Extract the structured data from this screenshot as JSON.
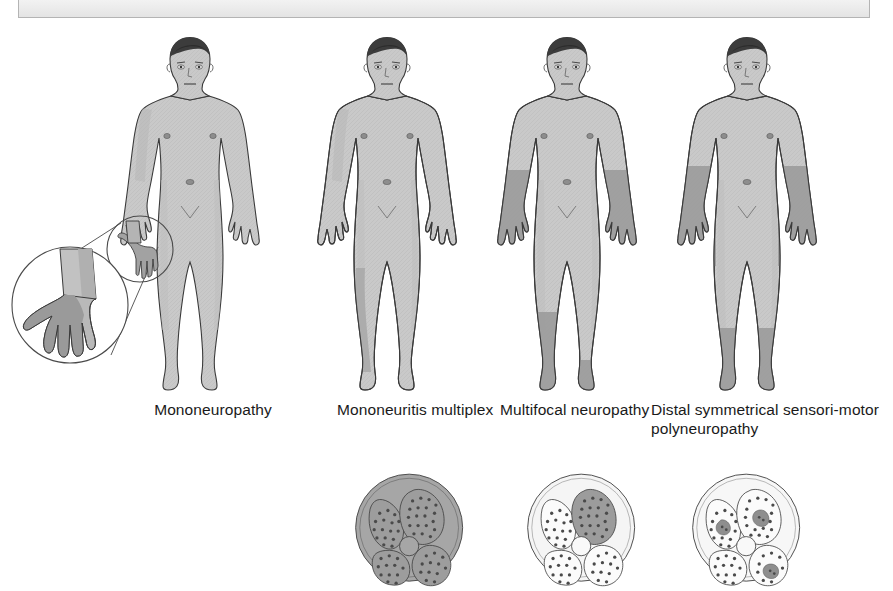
{
  "page": {
    "background_color": "#ffffff"
  },
  "top_box": {
    "name": "clipped-header-bar",
    "border_color": "#b4b4b4",
    "fill_color": "#f2f2f2",
    "text": ""
  },
  "palette": {
    "skin_light": "#c9c9c9",
    "skin_shadow": "#b0b0b0",
    "affected_gray": "#9a9a9a",
    "outline": "#3a3a3a",
    "hair_dark": "#3c3c3c",
    "nerve_fill_affected": "#a0a0a0",
    "nerve_fill_normal": "#f4f4f4",
    "nerve_sheath_affected": "#9b9b9b",
    "nerve_sheath_normal": "#f1f1f1",
    "axon_dot": "#4a4a4a"
  },
  "figures": [
    {
      "id": "fig1",
      "caption": "Mononeuropathy",
      "pattern": "single nerve territory — right hand median distribution",
      "affected_regions": [
        "right-hand-median-territory"
      ],
      "has_magnifier_inset": true,
      "inset": {
        "name": "hand-magnifier-inset",
        "small_circle_label": "",
        "large_circle_label": "",
        "shaded_area": "median nerve sensory territory of the hand"
      }
    },
    {
      "id": "fig2",
      "caption": "Mononeuritis multiplex",
      "pattern": "several separate individual nerves",
      "affected_regions": [
        "right-lateral-lower-leg"
      ],
      "has_magnifier_inset": false
    },
    {
      "id": "fig3",
      "caption": "Multifocal neuropathy",
      "pattern": "asymmetrical patchy involvement",
      "affected_regions": [
        "both-forearms",
        "right-lower-leg-and-foot",
        "left-ankle-and-foot"
      ],
      "has_magnifier_inset": false
    },
    {
      "id": "fig4",
      "caption": "Distal symmetrical sensori-motor polyneuropathy",
      "pattern": "symmetrical glove-and-stocking distribution",
      "affected_regions": [
        "both-forearms-and-hands",
        "both-lower-legs-and-feet"
      ],
      "has_magnifier_inset": false
    }
  ],
  "cross_sections": [
    {
      "id": "xs1",
      "name": "nerve-cross-section-diffuse",
      "description": "whole nerve trunk uniformly affected",
      "epineurium_shaded": true,
      "fascicles": [
        {
          "position": "upper-left",
          "affected": true
        },
        {
          "position": "upper-right",
          "affected": true
        },
        {
          "position": "lower-right",
          "affected": true
        },
        {
          "position": "lower-left",
          "affected": true
        }
      ],
      "central_vessel": true
    },
    {
      "id": "xs2",
      "name": "nerve-cross-section-single-fascicle",
      "description": "one entire fascicle affected",
      "epineurium_shaded": false,
      "fascicles": [
        {
          "position": "upper-left",
          "affected": false
        },
        {
          "position": "upper-right",
          "affected": true
        },
        {
          "position": "lower-right",
          "affected": false
        },
        {
          "position": "lower-left",
          "affected": false
        }
      ],
      "central_vessel": true
    },
    {
      "id": "xs3",
      "name": "nerve-cross-section-multifocal-centrofascicular",
      "description": "small central patches affected within several fascicles",
      "epineurium_shaded": false,
      "fascicles": [
        {
          "position": "upper-left",
          "affected": "central-patch"
        },
        {
          "position": "upper-right",
          "affected": "central-patch"
        },
        {
          "position": "lower-right",
          "affected": "central-patch"
        },
        {
          "position": "lower-left",
          "affected": false
        }
      ],
      "central_vessel": true
    }
  ]
}
